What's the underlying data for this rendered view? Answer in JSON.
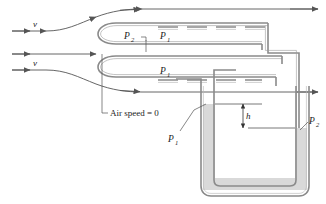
{
  "figure": {
    "background_color": "#ffffff",
    "line_color": "#555555",
    "tube_wall_color": "#8a8a8a",
    "liquid_color": "#d4d4d4",
    "text_color": "#1a1a1a"
  },
  "labels": {
    "velocity_upper": "v",
    "velocity_lower": "v",
    "p2_left": "P",
    "p2_left_sub": "2",
    "p1_upper": "P",
    "p1_upper_sub": "1",
    "p1_middle": "P",
    "p1_middle_sub": "1",
    "p1_manometer": "P",
    "p1_manometer_sub": "1",
    "p2_right": "P",
    "p2_right_sub": "2",
    "air_speed": "Air speed = 0",
    "height": "h"
  },
  "streamlines": {
    "count": 3,
    "arrow_label_upper": "v",
    "arrow_label_lower": "v",
    "stagnation_note": "Air speed = 0"
  },
  "manometer": {
    "height_label": "h",
    "left_port_label": "P1",
    "right_port_label": "P2",
    "liquid_fill": "#d4d4d4"
  }
}
